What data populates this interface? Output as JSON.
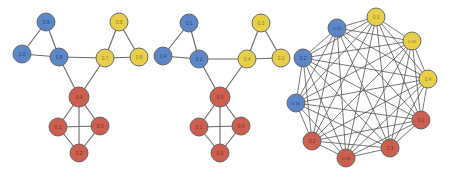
{
  "figure": {
    "width": 450,
    "height": 172,
    "background": "#ffffff",
    "panel_count": 3
  },
  "colors": {
    "blue": "#5b87c7",
    "yellow": "#e8cf4a",
    "red": "#cc5f4e",
    "edge": "#5a5a5a",
    "node_outline": "#5b5b5b",
    "blue_label": "#24407a",
    "yellow_label": "#8a7a12",
    "red_label": "#7a2a1c"
  },
  "chart_data": {
    "type": "diagram",
    "title": "",
    "subtitle": "",
    "xlabel": "",
    "ylabel": "",
    "legend": [],
    "graphs": [
      {
        "name": "graph-left",
        "layout": "community",
        "node_count": 10,
        "edge_count": 15,
        "nodes": [
          {
            "id": "L0",
            "label": "0.9",
            "group": "blue",
            "cx": 46,
            "cy": 22,
            "r": 9
          },
          {
            "id": "L1",
            "label": "1.0",
            "group": "blue",
            "cx": 22,
            "cy": 54,
            "r": 9
          },
          {
            "id": "L2",
            "label": "0.8",
            "group": "blue",
            "cx": 59,
            "cy": 57,
            "r": 9
          },
          {
            "id": "L3",
            "label": "0.5",
            "group": "yellow",
            "cx": 119,
            "cy": 22,
            "r": 9
          },
          {
            "id": "L4",
            "label": "0.7",
            "group": "yellow",
            "cx": 105,
            "cy": 58,
            "r": 9
          },
          {
            "id": "L5",
            "label": "0.6",
            "group": "yellow",
            "cx": 139,
            "cy": 57,
            "r": 9
          },
          {
            "id": "L6",
            "label": "0.4",
            "group": "red",
            "cx": 79,
            "cy": 97,
            "r": 10
          },
          {
            "id": "L7",
            "label": "0.1",
            "group": "red",
            "cx": 58,
            "cy": 127,
            "r": 9
          },
          {
            "id": "L8",
            "label": "0.3",
            "group": "red",
            "cx": 100,
            "cy": 126,
            "r": 9
          },
          {
            "id": "L9",
            "label": "0.2",
            "group": "red",
            "cx": 79,
            "cy": 153,
            "r": 9
          }
        ],
        "edges": [
          [
            "L0",
            "L1"
          ],
          [
            "L0",
            "L2"
          ],
          [
            "L1",
            "L2"
          ],
          [
            "L3",
            "L4"
          ],
          [
            "L3",
            "L5"
          ],
          [
            "L4",
            "L5"
          ],
          [
            "L2",
            "L4"
          ],
          [
            "L2",
            "L6"
          ],
          [
            "L4",
            "L6"
          ],
          [
            "L6",
            "L7"
          ],
          [
            "L6",
            "L8"
          ],
          [
            "L6",
            "L9"
          ],
          [
            "L7",
            "L8"
          ],
          [
            "L7",
            "L9"
          ],
          [
            "L8",
            "L9"
          ]
        ]
      },
      {
        "name": "graph-middle",
        "layout": "community",
        "node_count": 10,
        "edge_count": 15,
        "nodes": [
          {
            "id": "M0",
            "label": "0.1",
            "group": "blue",
            "cx": 189,
            "cy": 23,
            "r": 9
          },
          {
            "id": "M1",
            "label": "0.4",
            "group": "blue",
            "cx": 163,
            "cy": 56,
            "r": 9
          },
          {
            "id": "M2",
            "label": "0.2",
            "group": "blue",
            "cx": 199,
            "cy": 59,
            "r": 9
          },
          {
            "id": "M3",
            "label": "0.3",
            "group": "yellow",
            "cx": 261,
            "cy": 23,
            "r": 9
          },
          {
            "id": "M4",
            "label": "0.4",
            "group": "yellow",
            "cx": 247,
            "cy": 59,
            "r": 9
          },
          {
            "id": "M5",
            "label": "0.2",
            "group": "yellow",
            "cx": 281,
            "cy": 58,
            "r": 9
          },
          {
            "id": "M6",
            "label": "0.3",
            "group": "red",
            "cx": 220,
            "cy": 97,
            "r": 10
          },
          {
            "id": "M7",
            "label": "0.1",
            "group": "red",
            "cx": 199,
            "cy": 127,
            "r": 9
          },
          {
            "id": "M8",
            "label": "0.4",
            "group": "red",
            "cx": 241,
            "cy": 126,
            "r": 9
          },
          {
            "id": "M9",
            "label": "0.2",
            "group": "red",
            "cx": 220,
            "cy": 153,
            "r": 9
          }
        ],
        "edges": [
          [
            "M0",
            "M1"
          ],
          [
            "M0",
            "M2"
          ],
          [
            "M1",
            "M2"
          ],
          [
            "M3",
            "M4"
          ],
          [
            "M3",
            "M5"
          ],
          [
            "M4",
            "M5"
          ],
          [
            "M2",
            "M4"
          ],
          [
            "M2",
            "M6"
          ],
          [
            "M4",
            "M6"
          ],
          [
            "M6",
            "M7"
          ],
          [
            "M6",
            "M8"
          ],
          [
            "M6",
            "M9"
          ],
          [
            "M7",
            "M8"
          ],
          [
            "M7",
            "M9"
          ],
          [
            "M8",
            "M9"
          ]
        ]
      },
      {
        "name": "graph-right",
        "layout": "circular-complete",
        "complete": true,
        "node_count": 10,
        "edge_count": 45,
        "nodes": [
          {
            "id": "R0",
            "label": "0.3",
            "group": "yellow",
            "cx": 376,
            "cy": 17,
            "r": 9
          },
          {
            "id": "R1",
            "label": "0.45",
            "group": "yellow",
            "cx": 412,
            "cy": 41,
            "r": 9
          },
          {
            "id": "R2",
            "label": "0.4",
            "group": "yellow",
            "cx": 428,
            "cy": 79,
            "r": 9
          },
          {
            "id": "R3",
            "label": "0.2",
            "group": "red",
            "cx": 421,
            "cy": 120,
            "r": 9
          },
          {
            "id": "R4",
            "label": "0.3",
            "group": "red",
            "cx": 390,
            "cy": 148,
            "r": 9
          },
          {
            "id": "R5",
            "label": "0.28",
            "group": "red",
            "cx": 346,
            "cy": 158,
            "r": 9
          },
          {
            "id": "R6",
            "label": "0.2",
            "group": "red",
            "cx": 312,
            "cy": 141,
            "r": 9
          },
          {
            "id": "R7",
            "label": "0.15",
            "group": "blue",
            "cx": 296,
            "cy": 103,
            "r": 9
          },
          {
            "id": "R8",
            "label": "0.2",
            "group": "blue",
            "cx": 303,
            "cy": 58,
            "r": 9
          },
          {
            "id": "R9",
            "label": "0.25",
            "group": "blue",
            "cx": 337,
            "cy": 28,
            "r": 9
          }
        ],
        "edges": []
      }
    ]
  }
}
